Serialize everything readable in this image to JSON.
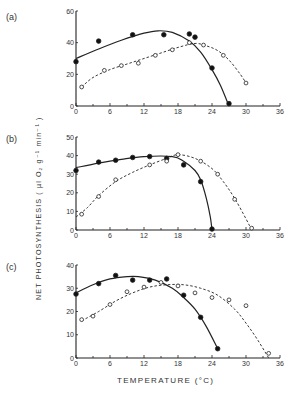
{
  "figure": {
    "ylabel": "NET PHOTOSYNTHESIS  ( µl O₂ g⁻¹ min⁻¹ )",
    "xlabel": "TEMPERATURE  (°C)"
  },
  "chart_data": [
    {
      "type": "line",
      "panel": "(a)",
      "xlabel": "TEMPERATURE (°C)",
      "ylabel": "NET PHOTOSYNTHESIS (µl O2 g-1 min-1)",
      "xlim": [
        0,
        36
      ],
      "ylim": [
        0,
        60
      ],
      "xticks": [
        0,
        6,
        12,
        18,
        24,
        30,
        36
      ],
      "yticks": [
        0,
        20,
        40,
        60
      ],
      "grid": false,
      "series": [
        {
          "name": "filled circles (solid line)",
          "marker": "filled",
          "line": "solid",
          "points": [
            [
              0,
              28
            ],
            [
              4,
              41
            ],
            [
              10,
              45
            ],
            [
              15.5,
              45
            ],
            [
              20,
              45.5
            ],
            [
              21,
              43.5
            ],
            [
              24,
              24
            ],
            [
              27,
              1.5
            ]
          ],
          "curve": [
            [
              0,
              30
            ],
            [
              4,
              36
            ],
            [
              8,
              41.5
            ],
            [
              12,
              46
            ],
            [
              14.5,
              47.5
            ],
            [
              17,
              46.5
            ],
            [
              20,
              41
            ],
            [
              22,
              34
            ],
            [
              24,
              23
            ],
            [
              25.5,
              13
            ],
            [
              27,
              0
            ]
          ]
        },
        {
          "name": "open circles (dashed line)",
          "marker": "open",
          "line": "dashed",
          "points": [
            [
              1,
              12
            ],
            [
              5,
              22.5
            ],
            [
              8,
              25.5
            ],
            [
              11,
              27
            ],
            [
              14,
              32
            ],
            [
              17,
              35.5
            ],
            [
              20,
              40
            ],
            [
              22.5,
              38.5
            ],
            [
              26,
              32
            ],
            [
              30,
              14.5
            ]
          ],
          "curve": [
            [
              1,
              12
            ],
            [
              3,
              18
            ],
            [
              6,
              23
            ],
            [
              9,
              26.5
            ],
            [
              12,
              30
            ],
            [
              15,
              33.5
            ],
            [
              18,
              37
            ],
            [
              21,
              39.5
            ],
            [
              23,
              38
            ],
            [
              25,
              35
            ],
            [
              27,
              29
            ],
            [
              29,
              20
            ],
            [
              30,
              14.5
            ]
          ]
        }
      ]
    },
    {
      "type": "line",
      "panel": "(b)",
      "xlim": [
        0,
        36
      ],
      "ylim": [
        0,
        50
      ],
      "xticks": [
        0,
        6,
        12,
        18,
        24,
        30,
        36
      ],
      "yticks": [
        0,
        10,
        20,
        30,
        40,
        50
      ],
      "grid": false,
      "series": [
        {
          "name": "filled circles (solid line)",
          "marker": "filled",
          "line": "solid",
          "points": [
            [
              0,
              32
            ],
            [
              4,
              36.5
            ],
            [
              7,
              37.5
            ],
            [
              10,
              39
            ],
            [
              13,
              39.5
            ],
            [
              16,
              38.5
            ],
            [
              19,
              35
            ],
            [
              22,
              26
            ],
            [
              24,
              0.5
            ]
          ],
          "curve": [
            [
              0,
              33.5
            ],
            [
              4,
              36
            ],
            [
              8,
              38
            ],
            [
              12,
              39.5
            ],
            [
              17,
              39.5
            ],
            [
              19,
              37
            ],
            [
              21,
              32
            ],
            [
              22,
              27
            ],
            [
              23,
              17
            ],
            [
              23.7,
              7
            ],
            [
              24,
              0
            ]
          ]
        },
        {
          "name": "open circles (dashed line)",
          "marker": "open",
          "line": "dashed",
          "points": [
            [
              1,
              8.5
            ],
            [
              4,
              18
            ],
            [
              7,
              27
            ],
            [
              13,
              35
            ],
            [
              16,
              37
            ],
            [
              18,
              40.5
            ],
            [
              22,
              37
            ],
            [
              25,
              30
            ],
            [
              28,
              16.5
            ],
            [
              31,
              1
            ]
          ],
          "curve": [
            [
              0,
              7
            ],
            [
              2,
              12
            ],
            [
              4,
              18.5
            ],
            [
              7,
              26
            ],
            [
              10,
              31
            ],
            [
              13,
              35
            ],
            [
              16,
              38.5
            ],
            [
              18,
              40.5
            ],
            [
              21,
              38.5
            ],
            [
              24,
              33
            ],
            [
              26,
              26
            ],
            [
              28,
              17
            ],
            [
              30,
              6
            ],
            [
              31,
              0
            ]
          ]
        }
      ]
    },
    {
      "type": "line",
      "panel": "(c)",
      "xlim": [
        0,
        36
      ],
      "ylim": [
        0,
        40
      ],
      "xticks": [
        0,
        6,
        12,
        18,
        24,
        30,
        36
      ],
      "yticks": [
        0,
        10,
        20,
        30,
        40
      ],
      "grid": false,
      "series": [
        {
          "name": "filled circles (solid line)",
          "marker": "filled",
          "line": "solid",
          "points": [
            [
              0,
              27.5
            ],
            [
              4,
              32
            ],
            [
              7,
              35.5
            ],
            [
              10,
              33.5
            ],
            [
              13,
              33.5
            ],
            [
              16,
              34
            ],
            [
              19,
              27
            ],
            [
              22,
              17.5
            ],
            [
              25,
              4
            ]
          ],
          "curve": [
            [
              0,
              28
            ],
            [
              3,
              31.5
            ],
            [
              6,
              34
            ],
            [
              9,
              35
            ],
            [
              11,
              35
            ],
            [
              14,
              33.5
            ],
            [
              17,
              30
            ],
            [
              19,
              26
            ],
            [
              21,
              21
            ],
            [
              23,
              13.5
            ],
            [
              25,
              4
            ]
          ]
        },
        {
          "name": "open circles (dashed line)",
          "marker": "open",
          "line": "dashed",
          "points": [
            [
              1,
              16.5
            ],
            [
              3,
              18
            ],
            [
              6,
              23
            ],
            [
              9,
              28.5
            ],
            [
              12,
              30.5
            ],
            [
              15,
              32.5
            ],
            [
              18,
              31
            ],
            [
              21,
              28
            ],
            [
              24,
              26
            ],
            [
              27,
              25
            ],
            [
              30,
              22.5
            ],
            [
              34,
              2
            ]
          ],
          "curve": [
            [
              1,
              16
            ],
            [
              4,
              20
            ],
            [
              7,
              24.5
            ],
            [
              10,
              28
            ],
            [
              13,
              30.5
            ],
            [
              16,
              31.5
            ],
            [
              19,
              31.5
            ],
            [
              22,
              30
            ],
            [
              25,
              27
            ],
            [
              28,
              21
            ],
            [
              30,
              15
            ],
            [
              32,
              8
            ],
            [
              34,
              0
            ]
          ]
        }
      ]
    }
  ]
}
